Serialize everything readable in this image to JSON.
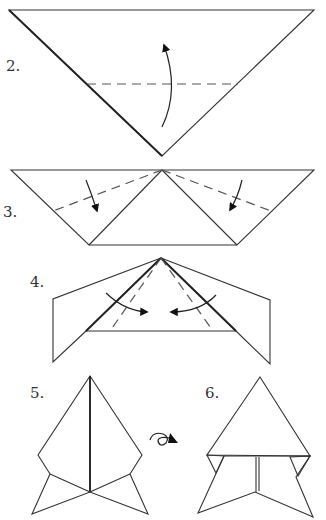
{
  "diagram": {
    "type": "origami-instructions",
    "steps": [
      {
        "number": "2.",
        "description": "Valley fold bottom point up along dashed line"
      },
      {
        "number": "3.",
        "description": "Valley fold both sides down along dashed lines"
      },
      {
        "number": "4.",
        "description": "Valley fold both flaps toward center along dashed lines"
      },
      {
        "number": "5.",
        "description": "Result, then turn over"
      },
      {
        "number": "6.",
        "description": "Finished model (reverse side)"
      }
    ],
    "symbols": {
      "turn_over": "turn-over-icon",
      "fold_arrow": "curved-arrow-icon",
      "valley_fold": "dashed-line"
    },
    "colors": {
      "line": "#333333",
      "background": "#ffffff"
    }
  }
}
